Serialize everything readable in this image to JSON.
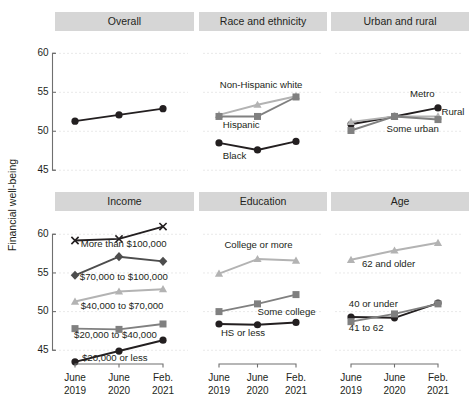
{
  "axis": {
    "ylabel": "Financial well-being",
    "yticks": [
      60,
      55,
      50,
      45
    ],
    "ylim": [
      44.0,
      61.2
    ],
    "xticks": [
      {
        "line1": "June",
        "line2": "2019"
      },
      {
        "line1": "June",
        "line2": "2020"
      },
      {
        "line1": "Feb.",
        "line2": "2021"
      }
    ]
  },
  "colors": {
    "black": "#231f20",
    "dark_gray": "#4d4d4d",
    "mid_gray": "#808080",
    "light_gray": "#b3b3b3",
    "band": "#d6d6d6",
    "grid": "#e9e9e9",
    "axis": "#6f6f6f"
  },
  "panels": [
    {
      "title": "Overall",
      "series": [
        {
          "name": "Overall",
          "label": "",
          "color": "#231f20",
          "marker": "circle",
          "values": [
            51.3,
            52.1,
            52.9
          ]
        }
      ]
    },
    {
      "title": "Race and ethnicity",
      "series": [
        {
          "name": "Non-Hispanic white",
          "label": "Non-Hispanic white",
          "color": "#b3b3b3",
          "marker": "triangle",
          "values": [
            52.1,
            53.4,
            54.5
          ],
          "label_x": 0.02,
          "label_y": 55.6,
          "anchor": "start"
        },
        {
          "name": "Hispanic",
          "label": "Hispanic",
          "color": "#808080",
          "marker": "square",
          "values": [
            51.9,
            51.9,
            54.4
          ],
          "label_x": 0.1,
          "label_y": 50.4,
          "anchor": "start"
        },
        {
          "name": "Black",
          "label": "Black",
          "color": "#231f20",
          "marker": "circle",
          "values": [
            48.5,
            47.6,
            48.7
          ],
          "label_x": 0.1,
          "label_y": 46.4,
          "anchor": "start"
        }
      ]
    },
    {
      "title": "Urban and rural",
      "series": [
        {
          "name": "Metro",
          "label": "Metro",
          "color": "#231f20",
          "marker": "circle",
          "values": [
            50.9,
            51.9,
            53.0
          ],
          "label_x": 1.92,
          "label_y": 54.4,
          "anchor": "end"
        },
        {
          "name": "Rural",
          "label": "Rural",
          "color": "#b3b3b3",
          "marker": "triangle",
          "values": [
            51.2,
            51.9,
            51.9
          ],
          "label_x": 2.08,
          "label_y": 52.1,
          "anchor": "start"
        },
        {
          "name": "Some urban",
          "label": "Some urban",
          "color": "#808080",
          "marker": "square",
          "values": [
            50.1,
            51.9,
            51.5
          ],
          "label_x": 2.02,
          "label_y": 49.9,
          "anchor": "end"
        }
      ]
    },
    {
      "title": "Income",
      "series": [
        {
          "name": "More than $100,000",
          "label": "More than $100,000",
          "color": "#231f20",
          "marker": "cross",
          "values": [
            59.2,
            59.4,
            61.0
          ],
          "label_x": 0.13,
          "label_y": 58.3,
          "anchor": "start"
        },
        {
          "name": "$70,000 to $100,000",
          "label": "$70,000 to $100,000",
          "color": "#4d4d4d",
          "marker": "diamond",
          "values": [
            54.7,
            57.1,
            56.5
          ],
          "label_x": 0.11,
          "label_y": 54.1,
          "anchor": "start"
        },
        {
          "name": "$40,000 to $70,000",
          "label": "$40,000 to $70,000",
          "color": "#b3b3b3",
          "marker": "triangle",
          "values": [
            51.3,
            52.6,
            52.9
          ],
          "label_x": 0.13,
          "label_y": 50.3,
          "anchor": "start"
        },
        {
          "name": "$20,000 to $40,000",
          "label": "$20,000 to $40,000",
          "color": "#808080",
          "marker": "square",
          "values": [
            47.8,
            47.7,
            48.4
          ],
          "label_x": -0.02,
          "label_y": 46.6,
          "anchor": "start"
        },
        {
          "name": "$20,000 or less",
          "label": "$20,000 or less",
          "color": "#231f20",
          "marker": "circle",
          "values": [
            43.5,
            44.9,
            46.3
          ],
          "label_x": 0.16,
          "label_y": 43.6,
          "anchor": "start"
        }
      ]
    },
    {
      "title": "Education",
      "series": [
        {
          "name": "College or more",
          "label": "College or more",
          "color": "#b3b3b3",
          "marker": "triangle",
          "values": [
            54.9,
            56.8,
            56.6
          ],
          "label_x": 0.14,
          "label_y": 58.2,
          "anchor": "start"
        },
        {
          "name": "Some college",
          "label": "Some college",
          "color": "#808080",
          "marker": "square",
          "values": [
            50.0,
            51.0,
            52.2
          ],
          "label_x": 1.0,
          "label_y": 49.5,
          "anchor": "start"
        },
        {
          "name": "HS or less",
          "label": "HS or less",
          "color": "#231f20",
          "marker": "circle",
          "values": [
            48.4,
            48.3,
            48.6
          ],
          "label_x": 0.05,
          "label_y": 46.9,
          "anchor": "start"
        }
      ]
    },
    {
      "title": "Age",
      "series": [
        {
          "name": "62 and older",
          "label": "62 and older",
          "color": "#b3b3b3",
          "marker": "triangle",
          "values": [
            56.7,
            57.9,
            58.9
          ],
          "label_x": 0.25,
          "label_y": 55.8,
          "anchor": "start"
        },
        {
          "name": "40 or under",
          "label": "40 or under",
          "color": "#231f20",
          "marker": "circle",
          "values": [
            49.3,
            49.2,
            51.1
          ],
          "label_x": -0.05,
          "label_y": 50.6,
          "anchor": "start"
        },
        {
          "name": "41 to 62",
          "label": "41 to 62",
          "color": "#808080",
          "marker": "square",
          "values": [
            48.7,
            49.7,
            51.0
          ],
          "label_x": -0.05,
          "label_y": 47.5,
          "anchor": "start"
        }
      ]
    }
  ],
  "chart_data": {
    "type": "line",
    "title": "",
    "xlabel": "",
    "ylabel": "Financial well-being",
    "x": [
      "June 2019",
      "June 2020",
      "Feb. 2021"
    ],
    "ylim": [
      44.0,
      61.2
    ],
    "yticks": [
      45,
      50,
      55,
      60
    ],
    "grid": true,
    "legend": "inline-labels",
    "panels": [
      {
        "panel": "Overall",
        "series": [
          {
            "name": "Overall",
            "values": [
              51.3,
              52.1,
              52.9
            ],
            "marker": "circle",
            "color": "#231f20"
          }
        ]
      },
      {
        "panel": "Race and ethnicity",
        "series": [
          {
            "name": "Non-Hispanic white",
            "values": [
              52.1,
              53.4,
              54.5
            ],
            "marker": "triangle",
            "color": "#b3b3b3"
          },
          {
            "name": "Hispanic",
            "values": [
              51.9,
              51.9,
              54.4
            ],
            "marker": "square",
            "color": "#808080"
          },
          {
            "name": "Black",
            "values": [
              48.5,
              47.6,
              48.7
            ],
            "marker": "circle",
            "color": "#231f20"
          }
        ]
      },
      {
        "panel": "Urban and rural",
        "series": [
          {
            "name": "Metro",
            "values": [
              50.9,
              51.9,
              53.0
            ],
            "marker": "circle",
            "color": "#231f20"
          },
          {
            "name": "Rural",
            "values": [
              51.2,
              51.9,
              51.9
            ],
            "marker": "triangle",
            "color": "#b3b3b3"
          },
          {
            "name": "Some urban",
            "values": [
              50.1,
              51.9,
              51.5
            ],
            "marker": "square",
            "color": "#808080"
          }
        ]
      },
      {
        "panel": "Income",
        "series": [
          {
            "name": "More than $100,000",
            "values": [
              59.2,
              59.4,
              61.0
            ],
            "marker": "cross",
            "color": "#231f20"
          },
          {
            "name": "$70,000 to $100,000",
            "values": [
              54.7,
              57.1,
              56.5
            ],
            "marker": "diamond",
            "color": "#4d4d4d"
          },
          {
            "name": "$40,000 to $70,000",
            "values": [
              51.3,
              52.6,
              52.9
            ],
            "marker": "triangle",
            "color": "#b3b3b3"
          },
          {
            "name": "$20,000 to $40,000",
            "values": [
              47.8,
              47.7,
              48.4
            ],
            "marker": "square",
            "color": "#808080"
          },
          {
            "name": "$20,000 or less",
            "values": [
              43.5,
              44.9,
              46.3
            ],
            "marker": "circle",
            "color": "#231f20"
          }
        ]
      },
      {
        "panel": "Education",
        "series": [
          {
            "name": "College or more",
            "values": [
              54.9,
              56.8,
              56.6
            ],
            "marker": "triangle",
            "color": "#b3b3b3"
          },
          {
            "name": "Some college",
            "values": [
              50.0,
              51.0,
              52.2
            ],
            "marker": "square",
            "color": "#808080"
          },
          {
            "name": "HS or less",
            "values": [
              48.4,
              48.3,
              48.6
            ],
            "marker": "circle",
            "color": "#231f20"
          }
        ]
      },
      {
        "panel": "Age",
        "series": [
          {
            "name": "62 and older",
            "values": [
              56.7,
              57.9,
              58.9
            ],
            "marker": "triangle",
            "color": "#b3b3b3"
          },
          {
            "name": "40 or under",
            "values": [
              49.3,
              49.2,
              51.1
            ],
            "marker": "circle",
            "color": "#231f20"
          },
          {
            "name": "41 to 62",
            "values": [
              48.7,
              49.7,
              51.0
            ],
            "marker": "square",
            "color": "#808080"
          }
        ]
      }
    ]
  }
}
